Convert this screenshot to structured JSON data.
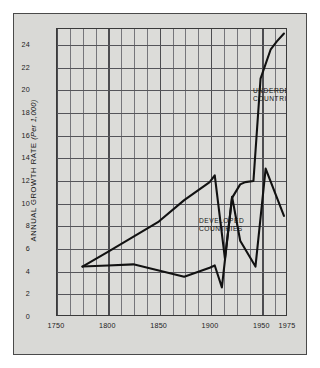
{
  "chart_data": {
    "type": "line",
    "title": "",
    "xlabel": "",
    "ylabel": "ANNUAL GROWTH RATE",
    "ylabel_unit": "(Per 1,000)",
    "xlim": [
      1750,
      1975
    ],
    "ylim": [
      0,
      25.4
    ],
    "grid": true,
    "legend_position": "inline-annotations",
    "xticks": [
      "1750",
      "1800",
      "1850",
      "1900",
      "1950",
      "1975"
    ],
    "xtick_values": [
      1750,
      1800,
      1850,
      1900,
      1950,
      1975
    ],
    "yticks": [
      "0",
      "2",
      "4",
      "6",
      "8",
      "10",
      "12",
      "14",
      "16",
      "18",
      "20",
      "22",
      "24"
    ],
    "ytick_values": [
      0,
      2,
      4,
      6,
      8,
      10,
      12,
      14,
      16,
      18,
      20,
      22,
      24
    ],
    "series": [
      {
        "name": "UNDERDEVELOPED\nCOUNTRIES",
        "label_short": "UNDERDEVELOPED COUNTRIES",
        "color": "#111111",
        "points": [
          [
            1775,
            4.3
          ],
          [
            1800,
            5.6
          ],
          [
            1850,
            8.3
          ],
          [
            1875,
            10.2
          ],
          [
            1900,
            11.8
          ],
          [
            1905,
            12.4
          ],
          [
            1915,
            5.0
          ],
          [
            1922,
            10.4
          ],
          [
            1930,
            11.6
          ],
          [
            1935,
            11.8
          ],
          [
            1943,
            11.9
          ],
          [
            1950,
            21.0
          ],
          [
            1960,
            23.6
          ],
          [
            1966,
            24.3
          ],
          [
            1973,
            25.0
          ]
        ]
      },
      {
        "name": "DEVELOPED\nCOUNTRIES",
        "label_short": "DEVELOPED COUNTRIES",
        "color": "#111111",
        "points": [
          [
            1775,
            4.3
          ],
          [
            1800,
            4.4
          ],
          [
            1825,
            4.5
          ],
          [
            1875,
            3.4
          ],
          [
            1900,
            4.2
          ],
          [
            1905,
            4.4
          ],
          [
            1912,
            2.45
          ],
          [
            1922,
            10.5
          ],
          [
            1930,
            6.6
          ],
          [
            1945,
            4.3
          ],
          [
            1955,
            13.0
          ],
          [
            1973,
            8.8
          ]
        ]
      }
    ]
  },
  "annotations": {
    "underdeveloped": "UNDERDEVELOPED\nCOUNTRIES",
    "developed": "DEVELOPED\nCOUNTRIES"
  },
  "style": {
    "panel_bg": "#d9d9d6",
    "plot_bg": "#dcdcd9",
    "grid_color": "#55555a",
    "line_color": "#111111",
    "border_color": "#3a3a3a"
  }
}
